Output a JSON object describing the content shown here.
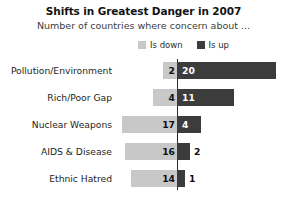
{
  "header": {
    "title": "Shifts in Greatest Danger in 2007",
    "subtitle": "Number of countries where concern about ..."
  },
  "legend": {
    "position": "top-right",
    "items": [
      {
        "label": "Is down",
        "color": "#c8c8c8",
        "icon": "square-swatch-icon"
      },
      {
        "label": "Is up",
        "color": "#3c3c3c",
        "icon": "square-swatch-icon"
      }
    ]
  },
  "chart_data": {
    "type": "bar",
    "orientation": "horizontal-diverging",
    "title": "Shifts in Greatest Danger in 2007",
    "subtitle": "Number of countries where concern about ...",
    "xlabel": "",
    "ylabel": "",
    "grid": false,
    "legend_position": "top-right",
    "categories": [
      "Pollution/Environment",
      "Rich/Poor Gap",
      "Nuclear Weapons",
      "AIDS & Disease",
      "Ethnic Hatred"
    ],
    "series": [
      {
        "name": "Is down",
        "color": "#c8c8c8",
        "direction": "left",
        "values": [
          2,
          4,
          17,
          16,
          14
        ]
      },
      {
        "name": "Is up",
        "color": "#3c3c3c",
        "direction": "right",
        "values": [
          20,
          11,
          4,
          2,
          1
        ]
      }
    ]
  },
  "rows": [
    {
      "label": "Pollution/Environment",
      "down": "2",
      "up": "20",
      "down_px": 14,
      "up_px": 99,
      "up_label_outside": false
    },
    {
      "label": "Rich/Poor Gap",
      "down": "4",
      "up": "11",
      "down_px": 24,
      "up_px": 57,
      "up_label_outside": false
    },
    {
      "label": "Nuclear Weapons",
      "down": "17",
      "up": "4",
      "down_px": 55,
      "up_px": 24,
      "up_label_outside": false
    },
    {
      "label": "AIDS & Disease",
      "down": "16",
      "up": "2",
      "down_px": 52,
      "up_px": 13,
      "up_label_outside": true
    },
    {
      "label": "Ethnic Hatred",
      "down": "14",
      "up": "1",
      "down_px": 46,
      "up_px": 8,
      "up_label_outside": true
    }
  ],
  "layout": {
    "axis_x": 177,
    "row_height": 27,
    "bar_height": 17
  }
}
